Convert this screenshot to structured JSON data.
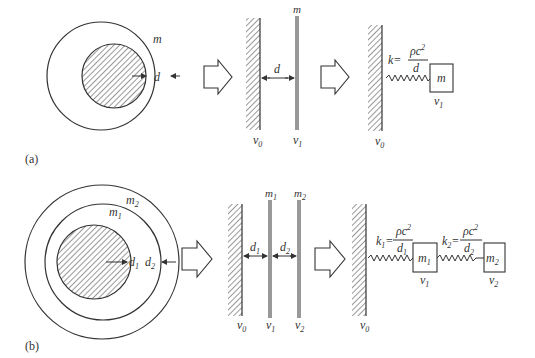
{
  "panels": {
    "a": {
      "caption": "(a)",
      "sphere": {
        "shell_label": "m",
        "gap_label": "d"
      },
      "plates": {
        "plate_label": "m",
        "gap_label": "d",
        "wall_velocity": "v",
        "wall_velocity_sub": "0",
        "plate_velocity": "v",
        "plate_velocity_sub": "1"
      },
      "spring_model": {
        "k_label": "k=",
        "numerator": "ρc",
        "numerator_sup": "2",
        "denominator": "d",
        "mass_label": "m",
        "mass_velocity": "v",
        "mass_velocity_sub": "1",
        "wall_velocity": "v",
        "wall_velocity_sub": "0"
      }
    },
    "b": {
      "caption": "(b)",
      "sphere": {
        "outer_shell_label": "m",
        "outer_shell_sub": "2",
        "inner_shell_label": "m",
        "inner_shell_sub": "1",
        "gap1_label": "d",
        "gap1_sub": "1",
        "gap2_label": "d",
        "gap2_sub": "2"
      },
      "plates": {
        "plate1_label": "m",
        "plate1_sub": "1",
        "plate2_label": "m",
        "plate2_sub": "2",
        "gap1_label": "d",
        "gap1_sub": "1",
        "gap2_label": "d",
        "gap2_sub": "2",
        "v0": "v",
        "v0_sub": "0",
        "v1": "v",
        "v1_sub": "1",
        "v2": "v",
        "v2_sub": "2"
      },
      "spring_model": {
        "k1_label": "k",
        "k1_sub": "1",
        "k1_eq": "=",
        "k1_numerator": "ρc",
        "k1_numerator_sup": "2",
        "k1_denominator": "d",
        "k1_denominator_sub": "1",
        "k2_label": "k",
        "k2_sub": "2",
        "k2_eq": "=",
        "k2_numerator": "ρc",
        "k2_numerator_sup": "2",
        "k2_denominator": "d",
        "k2_denominator_sub": "2",
        "mass1_label": "m",
        "mass1_sub": "1",
        "mass2_label": "m",
        "mass2_sub": "2",
        "mass1_velocity": "v",
        "mass1_velocity_sub": "1",
        "mass2_velocity": "v",
        "mass2_velocity_sub": "2",
        "wall_velocity": "v",
        "wall_velocity_sub": "0"
      }
    }
  }
}
